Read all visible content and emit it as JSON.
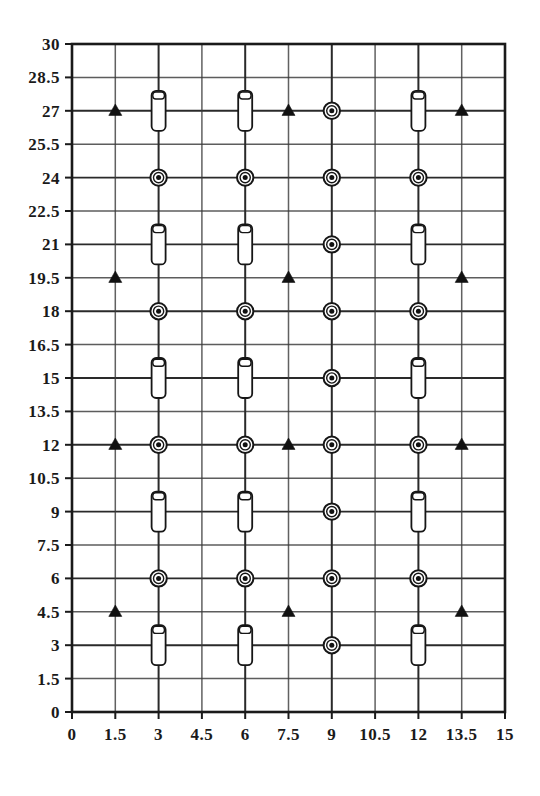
{
  "chart_data": {
    "type": "scatter",
    "title": "",
    "subtitle": "",
    "xlabel": "",
    "ylabel": "",
    "xlim": [
      0,
      15
    ],
    "ylim": [
      0,
      30
    ],
    "grid": true,
    "legend_position": "none",
    "x_ticks": [
      "0",
      "1.5",
      "3",
      "4.5",
      "6",
      "7.5",
      "9",
      "10.5",
      "12",
      "13.5",
      "15"
    ],
    "x_tick_values": [
      0,
      1.5,
      3,
      4.5,
      6,
      7.5,
      9,
      10.5,
      12,
      13.5,
      15
    ],
    "y_ticks": [
      "0",
      "1.5",
      "3",
      "4.5",
      "6",
      "7.5",
      "9",
      "10.5",
      "12",
      "13.5",
      "15",
      "16.5",
      "18",
      "19.5",
      "21",
      "22.5",
      "24",
      "25.5",
      "27",
      "28.5",
      "30"
    ],
    "y_tick_values": [
      0,
      1.5,
      3,
      4.5,
      6,
      7.5,
      9,
      10.5,
      12,
      13.5,
      15,
      16.5,
      18,
      19.5,
      21,
      22.5,
      24,
      25.5,
      27,
      28.5,
      30
    ],
    "series": [
      {
        "name": "triangle-marker",
        "symbol": "filled-triangle",
        "color": "#111111",
        "points": [
          {
            "x": 1.5,
            "y": 27
          },
          {
            "x": 7.5,
            "y": 27
          },
          {
            "x": 13.5,
            "y": 27
          },
          {
            "x": 1.5,
            "y": 19.5
          },
          {
            "x": 7.5,
            "y": 19.5
          },
          {
            "x": 13.5,
            "y": 19.5
          },
          {
            "x": 1.5,
            "y": 12
          },
          {
            "x": 7.5,
            "y": 12
          },
          {
            "x": 13.5,
            "y": 12
          },
          {
            "x": 1.5,
            "y": 4.5
          },
          {
            "x": 7.5,
            "y": 4.5
          },
          {
            "x": 13.5,
            "y": 4.5
          }
        ]
      },
      {
        "name": "bullseye-marker",
        "symbol": "circled-dot",
        "color": "#161616",
        "points": [
          {
            "x": 9,
            "y": 27
          },
          {
            "x": 3,
            "y": 24
          },
          {
            "x": 6,
            "y": 24
          },
          {
            "x": 9,
            "y": 24
          },
          {
            "x": 12,
            "y": 24
          },
          {
            "x": 9,
            "y": 21
          },
          {
            "x": 3,
            "y": 18
          },
          {
            "x": 6,
            "y": 18
          },
          {
            "x": 9,
            "y": 18
          },
          {
            "x": 12,
            "y": 18
          },
          {
            "x": 9,
            "y": 15
          },
          {
            "x": 3,
            "y": 12
          },
          {
            "x": 6,
            "y": 12
          },
          {
            "x": 9,
            "y": 12
          },
          {
            "x": 12,
            "y": 12
          },
          {
            "x": 9,
            "y": 9
          },
          {
            "x": 3,
            "y": 6
          },
          {
            "x": 6,
            "y": 6
          },
          {
            "x": 9,
            "y": 6
          },
          {
            "x": 12,
            "y": 6
          },
          {
            "x": 9,
            "y": 3
          }
        ]
      },
      {
        "name": "cylinder-marker",
        "symbol": "vertical-capsule",
        "color": "#161616",
        "points": [
          {
            "x": 3,
            "y": 27
          },
          {
            "x": 6,
            "y": 27
          },
          {
            "x": 12,
            "y": 27
          },
          {
            "x": 3,
            "y": 21
          },
          {
            "x": 6,
            "y": 21
          },
          {
            "x": 12,
            "y": 21
          },
          {
            "x": 3,
            "y": 15
          },
          {
            "x": 6,
            "y": 15
          },
          {
            "x": 12,
            "y": 15
          },
          {
            "x": 3,
            "y": 9
          },
          {
            "x": 6,
            "y": 9
          },
          {
            "x": 12,
            "y": 9
          },
          {
            "x": 3,
            "y": 3
          },
          {
            "x": 6,
            "y": 3
          },
          {
            "x": 12,
            "y": 3
          }
        ]
      }
    ]
  },
  "plot_geometry": {
    "left": 72,
    "right": 505,
    "top": 44,
    "bottom": 712
  }
}
